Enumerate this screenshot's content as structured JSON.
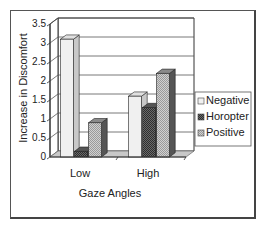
{
  "chart_data": {
    "type": "bar",
    "style": "3d-clustered",
    "title": "",
    "xlabel": "Gaze Angles",
    "ylabel": "Increase in Discomfort",
    "categories": [
      "Low",
      "High"
    ],
    "series": [
      {
        "name": "Negative",
        "values": [
          3.1,
          1.6
        ],
        "color": "#f2f2f2"
      },
      {
        "name": "Horopter",
        "values": [
          0.15,
          1.3
        ],
        "color": "#555555"
      },
      {
        "name": "Positive",
        "values": [
          0.9,
          2.2
        ],
        "color": "#b8b8b8"
      }
    ],
    "ylim": [
      0,
      3.5
    ],
    "yticks": [
      "0",
      "0.5",
      "1",
      "1.5",
      "2",
      "2.5",
      "3",
      "3.5"
    ],
    "grid": true,
    "legend": "right"
  }
}
